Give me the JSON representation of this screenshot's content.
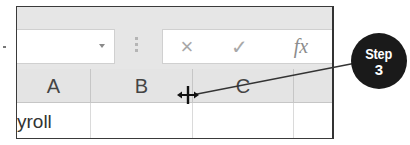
{
  "formula_bar": {
    "name_box_value": "",
    "cancel_icon": "×",
    "enter_icon": "✓",
    "fx_label": "fx"
  },
  "columns": [
    {
      "label": "A"
    },
    {
      "label": "B"
    },
    {
      "label": "C"
    }
  ],
  "rows": [
    {
      "cells": [
        "yroll",
        "",
        "",
        ""
      ]
    }
  ],
  "cursor": "column-resize-cursor",
  "callout": {
    "word": "Step",
    "number": "3"
  },
  "colors": {
    "ribbon_gray": "#e6e6e6",
    "header_gray": "#e4e4e4",
    "badge_bg": "#1a1a1a",
    "icon_gray": "#a8a8a8"
  }
}
